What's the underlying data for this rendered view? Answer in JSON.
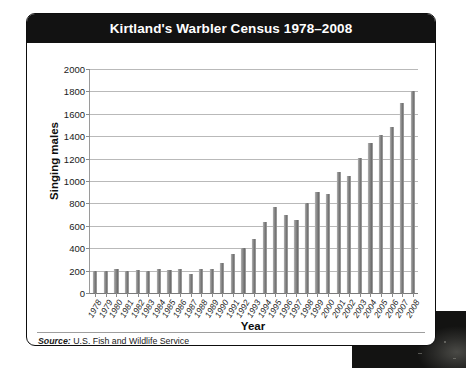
{
  "card": {
    "title": "Kirtland's Warbler Census 1978–2008",
    "source_prefix": "Source:",
    "source_text": "U.S. Fish and Wildlife Service"
  },
  "colors": {
    "title_bar": "#121212",
    "title_text": "#ffffff",
    "card_background": "#ffffff",
    "card_border": "#0d0d0d",
    "bar_fill": "#8c8c8c",
    "gridline": "#b9b9b9",
    "axis_line": "#7a7a7a",
    "tick_text": "#1a1a1a"
  },
  "chart_data": {
    "type": "bar",
    "title": "Kirtland's Warbler Census 1978–2008",
    "xlabel": "Year",
    "ylabel": "Singing males",
    "ylim": [
      0,
      2000
    ],
    "ytick_step": 200,
    "yticks": [
      0,
      200,
      400,
      600,
      800,
      1000,
      1200,
      1400,
      1600,
      1800,
      2000
    ],
    "grid": true,
    "legend": "none",
    "categories": [
      "1978",
      "1979",
      "1980",
      "1981",
      "1982",
      "1983",
      "1984",
      "1985",
      "1986",
      "1987",
      "1988",
      "1989",
      "1990",
      "1991",
      "1992",
      "1993",
      "1994",
      "1995",
      "1996",
      "1997",
      "1998",
      "1999",
      "2000",
      "2001",
      "2002",
      "2003",
      "2004",
      "2005",
      "2006",
      "2007",
      "2008"
    ],
    "values": [
      200,
      200,
      210,
      195,
      205,
      200,
      215,
      205,
      210,
      170,
      215,
      210,
      265,
      350,
      400,
      485,
      635,
      765,
      700,
      655,
      805,
      900,
      885,
      1080,
      1045,
      1205,
      1340,
      1415,
      1480,
      1700,
      1805
    ],
    "units": "singing males",
    "source": "U.S. Fish and Wildlife Service"
  }
}
